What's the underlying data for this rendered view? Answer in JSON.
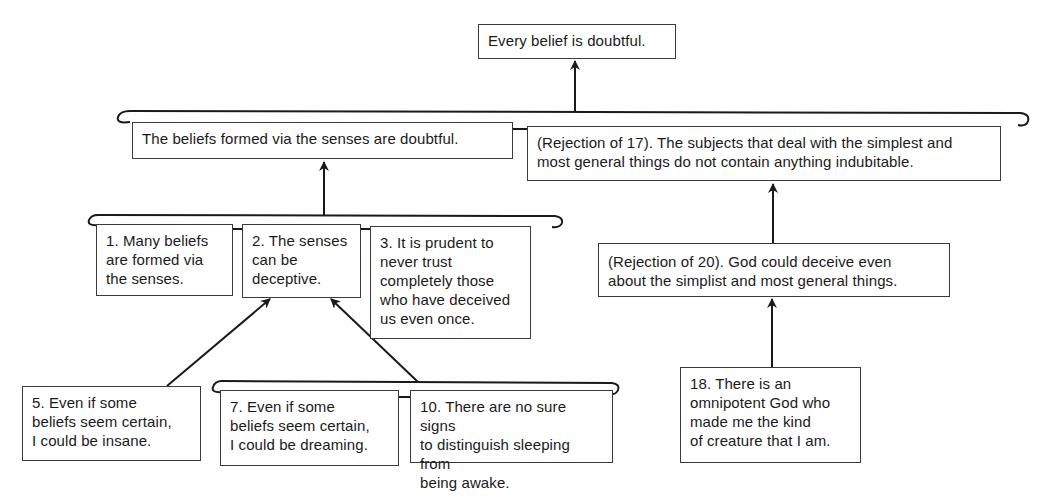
{
  "diagram": {
    "type": "argument-map",
    "nodes": {
      "root": {
        "text": "Every belief is doubtful."
      },
      "senses_doubtful": {
        "text": "The beliefs formed via the senses are doubtful."
      },
      "rejection_17": {
        "text": "(Rejection of 17). The subjects that deal with the simplest and\nmost general things do not contain anything indubitable."
      },
      "premise_1": {
        "text": "1. Many beliefs\nare formed via\nthe senses."
      },
      "premise_2": {
        "text": "2. The senses\ncan be\ndeceptive."
      },
      "premise_3": {
        "text": "3. It is prudent to\nnever trust\ncompletely those\nwho have deceived\nus even once."
      },
      "rejection_20": {
        "text": "(Rejection of 20). God could deceive even\nabout the simplist  and most general things."
      },
      "premise_5": {
        "text": "5. Even if some\nbeliefs seem certain,\nI could be insane."
      },
      "premise_7": {
        "text": "7. Even if some\nbeliefs seem certain,\nI could be dreaming."
      },
      "premise_10": {
        "text": "10. There are no sure signs\nto distinguish sleeping from\nbeing awake."
      },
      "premise_18": {
        "text": "18. There is an\nomnipotent God who\nmade me the kind\nof creature that I am."
      }
    },
    "edges": [
      {
        "from": [
          "senses_doubtful",
          "rejection_17"
        ],
        "to": "root",
        "joint": true
      },
      {
        "from": [
          "premise_1",
          "premise_2",
          "premise_3"
        ],
        "to": "senses_doubtful",
        "joint": true
      },
      {
        "from": [
          "rejection_20"
        ],
        "to": "rejection_17",
        "joint": false
      },
      {
        "from": [
          "premise_18"
        ],
        "to": "rejection_20",
        "joint": false
      },
      {
        "from": [
          "premise_5"
        ],
        "to": "premise_2",
        "joint": false
      },
      {
        "from": [
          "premise_7",
          "premise_10"
        ],
        "to": "premise_2",
        "joint": true
      }
    ],
    "colors": {
      "line": "#1a1a1a",
      "box_border": "#3a3a3a",
      "background": "#ffffff",
      "text": "#1a1a1a"
    }
  }
}
